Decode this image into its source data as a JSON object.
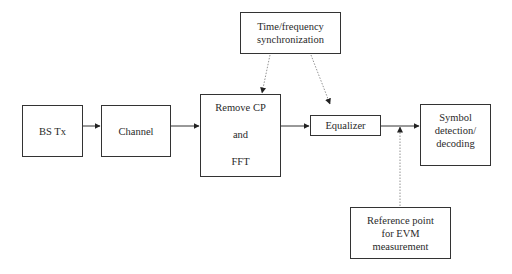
{
  "diagram": {
    "blocks": {
      "bs_tx": {
        "label": "BS Tx"
      },
      "channel": {
        "label": "Channel"
      },
      "remove_cp_fft": {
        "lines": [
          "Remove CP",
          "and",
          "FFT"
        ]
      },
      "time_freq_sync": {
        "lines": [
          "Time/frequency",
          "synchronization"
        ]
      },
      "equalizer": {
        "label": "Equalizer"
      },
      "symbol_detection": {
        "lines": [
          "Symbol",
          "detection/",
          "decoding"
        ]
      },
      "reference_point": {
        "lines": [
          "Reference point",
          "for EVM",
          "measurement"
        ]
      }
    },
    "connections": [
      {
        "from": "bs_tx",
        "to": "channel",
        "style": "solid"
      },
      {
        "from": "channel",
        "to": "remove_cp_fft",
        "style": "solid"
      },
      {
        "from": "remove_cp_fft",
        "to": "equalizer",
        "style": "solid"
      },
      {
        "from": "equalizer",
        "to": "symbol_detection",
        "style": "solid"
      },
      {
        "from": "time_freq_sync",
        "to": "remove_cp_fft",
        "style": "dotted"
      },
      {
        "from": "time_freq_sync",
        "to": "equalizer",
        "style": "dotted"
      },
      {
        "from": "reference_point",
        "to": "equalizer_output_line",
        "style": "dotted"
      }
    ],
    "colors": {
      "line": "#333333",
      "dotted_line": "#777777",
      "background": "#ffffff"
    }
  }
}
